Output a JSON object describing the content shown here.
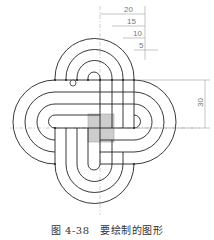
{
  "figure": {
    "caption": "图 4-38　要绘制的图形",
    "dimensions": {
      "top": [
        "20",
        "15",
        "10",
        "5"
      ],
      "right": "30"
    },
    "colors": {
      "line": "#222222",
      "centerline": "#888888",
      "dimension": "#888888",
      "center_square": "#bdbdbd"
    }
  }
}
